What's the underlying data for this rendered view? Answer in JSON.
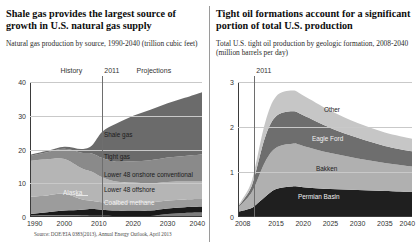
{
  "left": {
    "headline": "Shale gas provides the largest source of growth in U.S. natural gas supply",
    "subhead": "Natural gas production by source, 1990-2040 (trillion cubic feet)",
    "source": "Source: DOE/EIA 0383(2013), Annual Energy Outlook, April 2013",
    "era_history": "History",
    "era_projection": "Projections",
    "divider_year": "2011",
    "chart_data": {
      "type": "area",
      "title": "Natural gas production by source",
      "xlabel": "",
      "ylabel": "trillion cubic feet",
      "xlim": [
        1990,
        2040
      ],
      "ylim": [
        0,
        40
      ],
      "yticks": [
        0,
        10,
        20,
        30,
        40
      ],
      "xticks": [
        1990,
        2000,
        2010,
        2020,
        2030,
        2040
      ],
      "grid": true,
      "divider_x": 2011,
      "x": [
        1990,
        1995,
        2000,
        2005,
        2008,
        2011,
        2015,
        2020,
        2025,
        2030,
        2035,
        2040
      ],
      "series": [
        {
          "name": "Alaska",
          "values": [
            0.4,
            0.5,
            0.5,
            0.45,
            0.4,
            0.35,
            0.3,
            0.3,
            0.3,
            0.9,
            1.2,
            1.3
          ],
          "color": "#7d7d7d"
        },
        {
          "name": "Coalbed methane",
          "values": [
            0.5,
            0.9,
            1.4,
            1.7,
            2.0,
            1.8,
            1.6,
            1.6,
            1.6,
            1.6,
            1.7,
            1.8
          ],
          "color": "#1a1a1a"
        },
        {
          "name": "Lower 48 offshore",
          "values": [
            5.1,
            5.0,
            5.0,
            3.1,
            2.4,
            2.2,
            2.1,
            2.3,
            2.4,
            2.4,
            2.3,
            2.2
          ],
          "color": "#9c9c9c"
        },
        {
          "name": "Lower 48 onshore conventional",
          "values": [
            10.6,
            10.7,
            10.3,
            9.2,
            8.6,
            7.4,
            6.5,
            6.0,
            5.7,
            5.5,
            5.3,
            5.2
          ],
          "color": "#b5b5b5"
        },
        {
          "name": "Tight gas",
          "values": [
            1.5,
            2.1,
            3.0,
            4.6,
            5.4,
            5.7,
            5.9,
            6.3,
            6.8,
            7.2,
            7.6,
            8.0
          ],
          "color": "#8a8a8a"
        },
        {
          "name": "Shale gas",
          "values": [
            0.3,
            0.4,
            0.6,
            1.1,
            2.4,
            7.8,
            11.2,
            13.5,
            15.0,
            16.1,
            17.2,
            18.5
          ],
          "color": "#6b6b6b"
        }
      ],
      "labels": [
        "Shale gas",
        "Tight gas",
        "Lower 48 onshore conventional",
        "Lower 48 offshore",
        "Coalbed methane",
        "Alaska"
      ]
    }
  },
  "right": {
    "headline": "Tight oil formations account for a significant portion of total U.S. production",
    "subhead": "Total U.S. tight oil production by geologic formation, 2008-2040 (million barrels per day)",
    "divider_year": "2011",
    "chart_data": {
      "type": "area",
      "title": "Total U.S. tight oil production by geologic formation",
      "xlabel": "",
      "ylabel": "million barrels per day",
      "xlim": [
        2008,
        2040
      ],
      "ylim": [
        0,
        3
      ],
      "yticks": [
        0,
        1,
        2,
        3
      ],
      "xticks": [
        2008,
        2015,
        2020,
        2025,
        2030,
        2035,
        2040
      ],
      "grid": true,
      "divider_x": 2011,
      "x": [
        2008,
        2010,
        2011,
        2013,
        2015,
        2018,
        2020,
        2025,
        2030,
        2035,
        2040
      ],
      "series": [
        {
          "name": "Permian Basin",
          "values": [
            0.12,
            0.18,
            0.24,
            0.45,
            0.62,
            0.68,
            0.66,
            0.62,
            0.6,
            0.58,
            0.56
          ],
          "color": "#1f1f1f"
        },
        {
          "name": "Bakken",
          "values": [
            0.08,
            0.28,
            0.42,
            0.78,
            0.92,
            0.95,
            0.92,
            0.8,
            0.7,
            0.62,
            0.56
          ],
          "color": "#b0b0b0"
        },
        {
          "name": "Eagle Ford",
          "values": [
            0.02,
            0.1,
            0.22,
            0.55,
            0.7,
            0.72,
            0.68,
            0.56,
            0.46,
            0.38,
            0.34
          ],
          "color": "#6e6e6e"
        },
        {
          "name": "Other",
          "values": [
            0.03,
            0.08,
            0.14,
            0.32,
            0.44,
            0.46,
            0.44,
            0.38,
            0.33,
            0.3,
            0.28
          ],
          "color": "#c6c6c6"
        }
      ],
      "labels": [
        "Other",
        "Eagle Ford",
        "Bakken",
        "Permian Basin"
      ]
    }
  }
}
